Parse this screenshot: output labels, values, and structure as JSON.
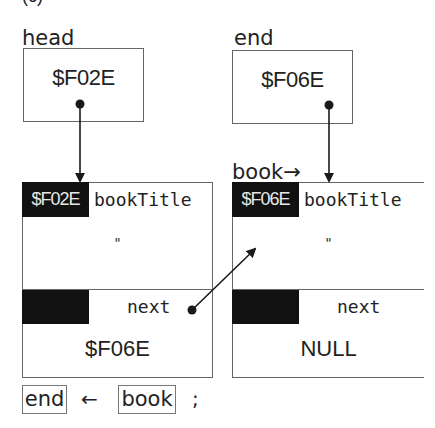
{
  "figure": {
    "caption_cut": "(c)"
  },
  "pointers": {
    "head": {
      "label": "head",
      "value": "$F02E"
    },
    "end": {
      "label": "end",
      "value": "$F06E"
    }
  },
  "book_pointer_label": "book→",
  "nodes": [
    {
      "address": "$F02E",
      "field_title": "bookTitle",
      "title_value": "\"",
      "field_next": "next",
      "next_value": "$F06E"
    },
    {
      "address": "$F06E",
      "field_title": "bookTitle",
      "title_value": "\"",
      "field_next": "next",
      "next_value": "NULL"
    }
  ],
  "statement": {
    "lhs": "end",
    "op": "←",
    "rhs": "book",
    "terminator": ";"
  },
  "colors": {
    "ink": "#1a1a1a",
    "border": "#666666",
    "tag_bg": "#111111",
    "tag_text": "#e8e8e8"
  }
}
